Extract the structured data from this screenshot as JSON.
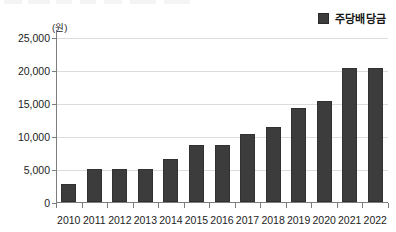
{
  "legend": {
    "swatch_color": "#3c3c3c",
    "label": "주당배당금"
  },
  "axis": {
    "unit_label": "(원)"
  },
  "chart_data": {
    "type": "bar",
    "title": "",
    "subtitle": "",
    "xlabel": "",
    "ylabel": "(원)",
    "ylim": [
      0,
      25000
    ],
    "yticks": [
      0,
      5000,
      10000,
      15000,
      20000,
      25000
    ],
    "ytick_labels": [
      "0",
      "5,000",
      "10,000",
      "15,000",
      "20,000",
      "25,000"
    ],
    "grid": true,
    "legend_position": "top-right",
    "bar_color": "#3c3c3c",
    "categories": [
      "2010",
      "2011",
      "2012",
      "2013",
      "2014",
      "2015",
      "2016",
      "2017",
      "2018",
      "2019",
      "2020",
      "2021",
      "2022"
    ],
    "series": [
      {
        "name": "주당배당금",
        "values": [
          2700,
          5000,
          5000,
          5000,
          6550,
          8650,
          8650,
          10250,
          11300,
          14200,
          15250,
          20250,
          20250
        ]
      }
    ]
  }
}
